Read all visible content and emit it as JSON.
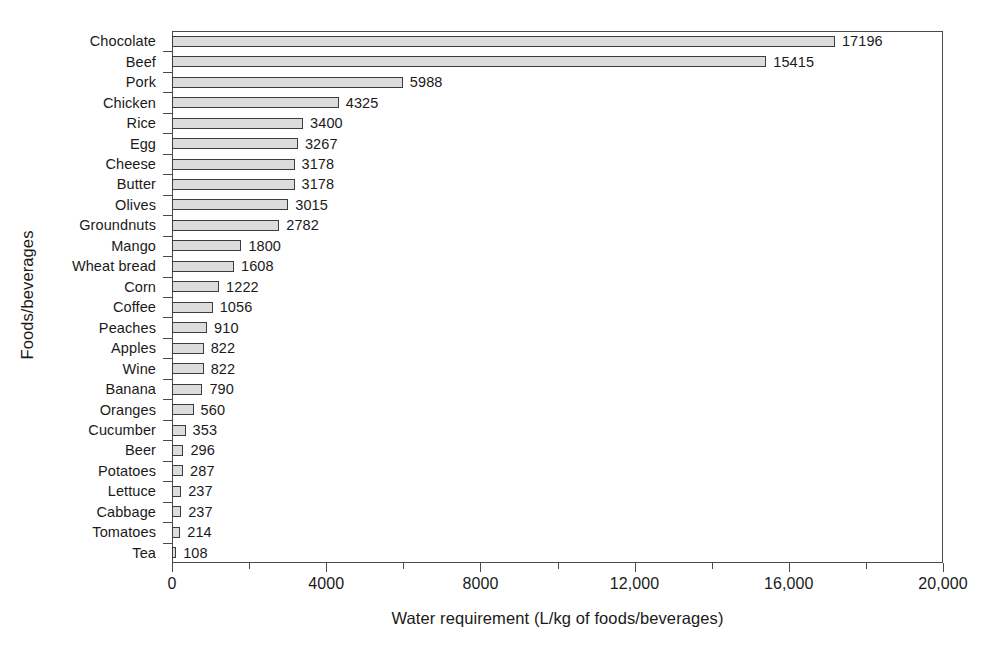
{
  "chart_data": {
    "type": "bar",
    "orientation": "horizontal",
    "title": "",
    "xlabel": "Water requirement (L/kg of foods/beverages)",
    "ylabel": "Foods/beverages",
    "xlim": [
      0,
      20000
    ],
    "grid": false,
    "legend": null,
    "categories": [
      "Chocolate",
      "Beef",
      "Pork",
      "Chicken",
      "Rice",
      "Egg",
      "Cheese",
      "Butter",
      "Olives",
      "Groundnuts",
      "Mango",
      "Wheat bread",
      "Corn",
      "Coffee",
      "Peaches",
      "Apples",
      "Wine",
      "Banana",
      "Oranges",
      "Cucumber",
      "Beer",
      "Potatoes",
      "Lettuce",
      "Cabbage",
      "Tomatoes",
      "Tea"
    ],
    "values": [
      17196,
      15415,
      5988,
      4325,
      3400,
      3267,
      3178,
      3178,
      3015,
      2782,
      1800,
      1608,
      1222,
      1056,
      910,
      822,
      822,
      790,
      560,
      353,
      296,
      287,
      237,
      237,
      214,
      108
    ],
    "value_labels": [
      "17196",
      "15415",
      "5988",
      "4325",
      "3400",
      "3267",
      "3178",
      "3178",
      "3015",
      "2782",
      "1800",
      "1608",
      "1222",
      "1056",
      "910",
      "822",
      "822",
      "790",
      "560",
      "353",
      "296",
      "287",
      "237",
      "237",
      "214",
      "108"
    ],
    "x_ticks": [
      0,
      4000,
      8000,
      12000,
      16000,
      20000
    ],
    "x_tick_labels": [
      "0",
      "4000",
      "8000",
      "12,000",
      "16,000",
      "20,000"
    ],
    "x_minor_ticks": [
      2000,
      6000,
      10000,
      14000,
      18000
    ],
    "bar_fill_color": "#dcdcdc",
    "bar_edge_color": "#3d3d3d",
    "axis_color": "#4a4a4a",
    "background_color": "#ffffff"
  }
}
